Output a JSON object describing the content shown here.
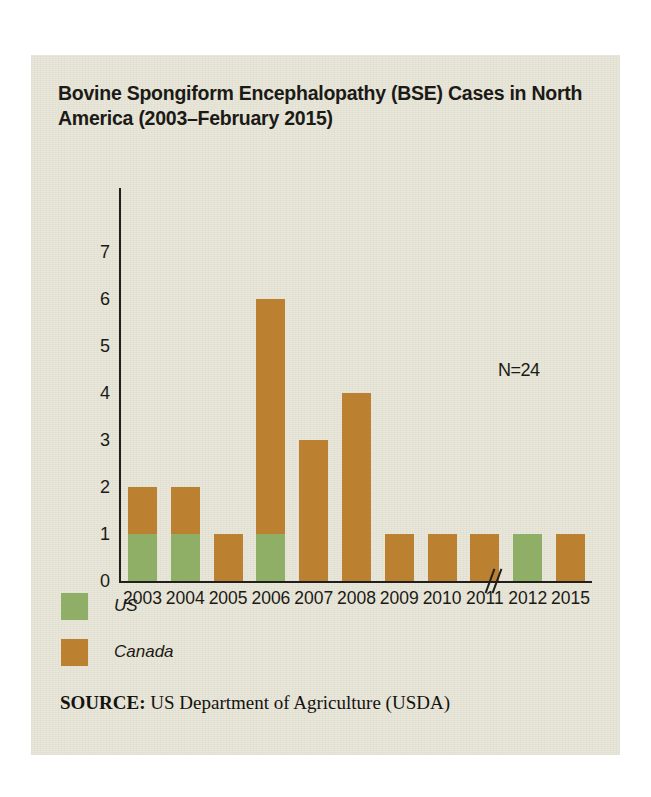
{
  "chart_data": {
    "type": "bar",
    "title": "Bovine Spongiform Encephalopathy (BSE) Cases in North America (2003–February 2015)",
    "xlabel": "",
    "ylabel": "",
    "ylim": [
      0,
      7
    ],
    "yticks": [
      "7",
      "6",
      "5",
      "4",
      "3",
      "2",
      "1",
      "0"
    ],
    "categories": [
      "2003",
      "2004",
      "2005",
      "2006",
      "2007",
      "2008",
      "2009",
      "2010",
      "2011",
      "2012",
      "2015"
    ],
    "stacked": true,
    "grid": false,
    "legend_position": "below-left",
    "axis_break_after_category": "2012",
    "axis_break_symbol": "//",
    "annotation": "N=24",
    "series": [
      {
        "name": "US",
        "color": "#8fae66",
        "values": [
          1,
          1,
          0,
          1,
          0,
          0,
          0,
          0,
          0,
          1,
          0
        ]
      },
      {
        "name": "Canada",
        "color": "#bb8030",
        "values": [
          1,
          1,
          1,
          5,
          3,
          4,
          1,
          1,
          1,
          0,
          1
        ]
      }
    ],
    "totals": [
      2,
      2,
      1,
      6,
      3,
      4,
      1,
      1,
      1,
      1,
      1
    ]
  },
  "legend": {
    "items": [
      {
        "label": "US",
        "color": "#8fae66"
      },
      {
        "label": "Canada",
        "color": "#bb8030"
      }
    ]
  },
  "source": {
    "key": "SOURCE:",
    "text": " US Department of Agriculture (USDA)"
  },
  "colors": {
    "panel_background": "#e9e7da",
    "page_background": "#ffffff",
    "axis": "#211f1b",
    "text": "#1b1a16",
    "us": "#8fae66",
    "canada": "#bb8030"
  }
}
